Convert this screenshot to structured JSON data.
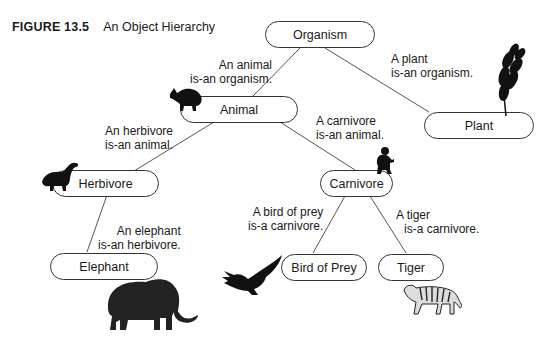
{
  "figure": {
    "number": "FIGURE 13.5",
    "title": "An Object Hierarchy"
  },
  "nodes": {
    "organism": "Organism",
    "animal": "Animal",
    "plant": "Plant",
    "herbivore": "Herbivore",
    "carnivore": "Carnivore",
    "elephant": "Elephant",
    "bird_of_prey": "Bird of Prey",
    "tiger": "Tiger"
  },
  "relations": {
    "animal_organism": [
      "An animal",
      "is-an organism."
    ],
    "plant_organism": [
      "A plant",
      "is-an organism."
    ],
    "herbivore_animal": [
      "An herbivore",
      "is-an animal."
    ],
    "carnivore_animal": [
      "A carnivore",
      "is-an animal."
    ],
    "elephant_herbivore": [
      "An elephant",
      "is-an herbivore."
    ],
    "bird_carnivore": [
      "A bird of prey",
      "is-a carnivore."
    ],
    "tiger_carnivore": [
      "A tiger",
      "is-a carnivore."
    ]
  },
  "illustrations": [
    "aardvark-icon",
    "wheat-icon",
    "dinosaur-icon",
    "monkey-icon",
    "elephant-icon",
    "eagle-icon",
    "tiger-icon"
  ],
  "colors": {
    "line": "#555555",
    "text": "#1a1a1a",
    "silhouette": "#111111"
  }
}
